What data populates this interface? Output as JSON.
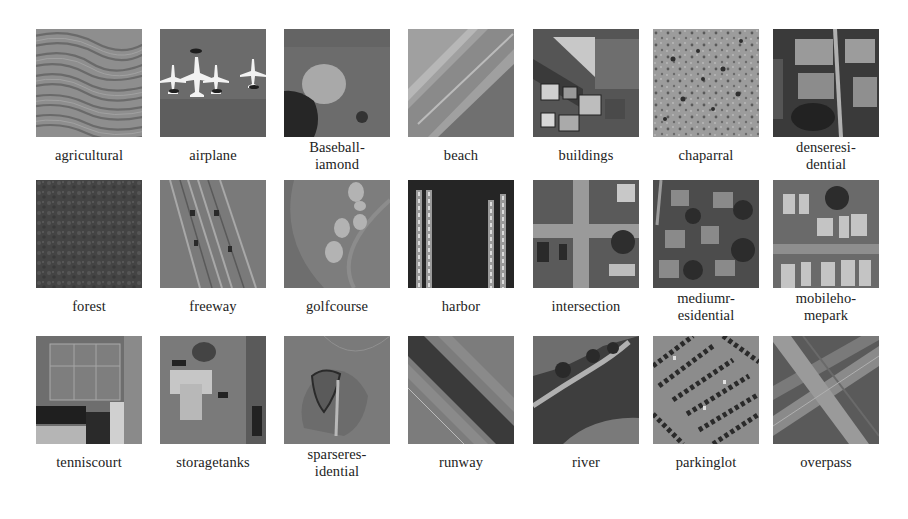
{
  "figure": {
    "rows": [
      [
        {
          "label": "agricultural",
          "icon": "agricultural-image"
        },
        {
          "label": "airplane",
          "icon": "airplane-image"
        },
        {
          "label": "Baseball-\niamond",
          "icon": "baseball-diamond-image"
        },
        {
          "label": "beach",
          "icon": "beach-image"
        },
        {
          "label": "buildings",
          "icon": "buildings-image"
        },
        {
          "label": "chaparral",
          "icon": "chaparral-image"
        },
        {
          "label": "denseresi-\ndential",
          "icon": "dense-residential-image"
        }
      ],
      [
        {
          "label": "forest",
          "icon": "forest-image"
        },
        {
          "label": "freeway",
          "icon": "freeway-image"
        },
        {
          "label": "golfcourse",
          "icon": "golfcourse-image"
        },
        {
          "label": "harbor",
          "icon": "harbor-image"
        },
        {
          "label": "intersection",
          "icon": "intersection-image"
        },
        {
          "label": "mediumr-\nesidential",
          "icon": "medium-residential-image"
        },
        {
          "label": "mobileho-\nmepark",
          "icon": "mobile-home-park-image"
        }
      ],
      [
        {
          "label": "tenniscourt",
          "icon": "tenniscourt-image"
        },
        {
          "label": "storagetanks",
          "icon": "storagetanks-image"
        },
        {
          "label": "sparseres-\nidential",
          "icon": "sparse-residential-image"
        },
        {
          "label": "runway",
          "icon": "runway-image"
        },
        {
          "label": "river",
          "icon": "river-image"
        },
        {
          "label": "parkinglot",
          "icon": "parkinglot-image"
        },
        {
          "label": "overpass",
          "icon": "overpass-image"
        }
      ]
    ]
  },
  "labels": {
    "r0c0": "agricultural",
    "r0c1": "airplane",
    "r0c2a": "Baseball-",
    "r0c2b": "iamond",
    "r0c3": "beach",
    "r0c4": "buildings",
    "r0c5": "chaparral",
    "r0c6a": "denseresi-",
    "r0c6b": "dential",
    "r1c0": "forest",
    "r1c1": "freeway",
    "r1c2": "golfcourse",
    "r1c3": "harbor",
    "r1c4": "intersection",
    "r1c5a": "mediumr-",
    "r1c5b": "esidential",
    "r1c6a": "mobileho-",
    "r1c6b": "mepark",
    "r2c0": "tenniscourt",
    "r2c1": "storagetanks",
    "r2c2a": "sparseres-",
    "r2c2b": "idential",
    "r2c3": "runway",
    "r2c4": "river",
    "r2c5": "parkinglot",
    "r2c6": "overpass"
  },
  "colors": {
    "background": "#ffffff",
    "label_text": "#222222"
  }
}
